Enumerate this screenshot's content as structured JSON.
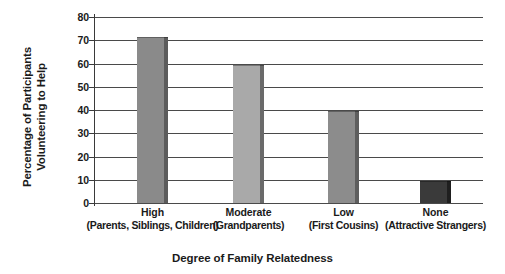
{
  "chart_data": {
    "type": "bar",
    "title": "",
    "xlabel": "Degree of Family Relatedness",
    "ylabel_line1": "Percentage of Participants",
    "ylabel_line2": "Volunteering to Help",
    "categories": [
      "High",
      "Moderate",
      "Low",
      "None"
    ],
    "category_sublabels": [
      "(Parents, Siblings, Children)",
      "(Grandparents)",
      "(First Cousins)",
      "(Attractive Strangers)"
    ],
    "values": [
      71.5,
      59.5,
      39.5,
      9.3
    ],
    "ylim": [
      0,
      80
    ],
    "ytick_labels": [
      "80",
      "70",
      "60",
      "50",
      "40",
      "30",
      "20",
      "10",
      "0"
    ],
    "ytick_values": [
      80,
      70,
      60,
      50,
      40,
      30,
      20,
      10,
      0
    ],
    "grid": true,
    "legend": "none",
    "bar_colors": [
      "#8a8a8a",
      "#a9a9a9",
      "#8c8c8c",
      "#3a3a3a"
    ],
    "bar_edge_colors": [
      "#5c5c5c",
      "#6a6a6a",
      "#5e5e5e",
      "#1f1f1f"
    ],
    "grid_color": "#4a4a4a",
    "axis_color": "#3a3a3a",
    "background_color": "#ffffff",
    "text_color": "#1a1a1a"
  }
}
